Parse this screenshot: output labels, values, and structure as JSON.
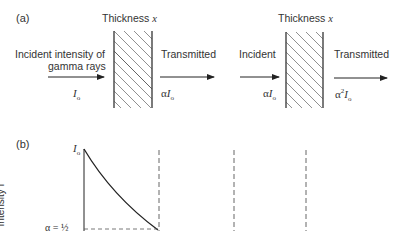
{
  "panel_a": {
    "label": "(a)",
    "slab1": {
      "title_prefix": "Thickness ",
      "title_var": "x"
    },
    "slab2": {
      "title_prefix": "Thickness ",
      "title_var": "x"
    },
    "incident1": {
      "line1": "Incident intensity of",
      "line2": "gamma rays",
      "value": "I",
      "value_sub": "o"
    },
    "transmitted1": {
      "label": "Transmitted",
      "value_prefix": "α",
      "value": "I",
      "value_sub": "o"
    },
    "incident2": {
      "label": "Incident",
      "value_prefix": "α",
      "value": "I",
      "value_sub": "o"
    },
    "transmitted2": {
      "label": "Transmitted",
      "value_prefix": "α",
      "value_sup": "2",
      "value": "I",
      "value_sub": "o"
    }
  },
  "panel_b": {
    "label": "(b)",
    "y_axis_label": "Intensity I",
    "y_top_label": "I",
    "y_top_sub": "o",
    "alpha_label": "α = ½"
  },
  "colors": {
    "line": "#222222",
    "dash": "#555555",
    "text": "#333333"
  }
}
